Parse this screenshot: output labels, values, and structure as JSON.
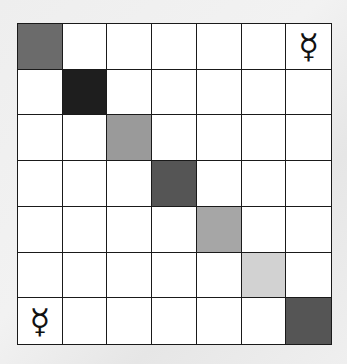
{
  "board": {
    "rows": 7,
    "cols": 7,
    "line_color": "#1a1a1a",
    "empty_color": "#ffffff",
    "shaded_cells": [
      {
        "row": 0,
        "col": 0,
        "color": "#6b6b6b"
      },
      {
        "row": 1,
        "col": 1,
        "color": "#1e1e1e"
      },
      {
        "row": 2,
        "col": 2,
        "color": "#9a9a9a"
      },
      {
        "row": 3,
        "col": 3,
        "color": "#555555"
      },
      {
        "row": 4,
        "col": 4,
        "color": "#a6a6a6"
      },
      {
        "row": 5,
        "col": 5,
        "color": "#d2d2d2"
      },
      {
        "row": 6,
        "col": 6,
        "color": "#555555"
      }
    ],
    "symbols": [
      {
        "row": 0,
        "col": 6,
        "glyph": "☿",
        "name": "mercury-symbol"
      },
      {
        "row": 6,
        "col": 0,
        "glyph": "☿",
        "name": "mercury-symbol"
      }
    ]
  }
}
